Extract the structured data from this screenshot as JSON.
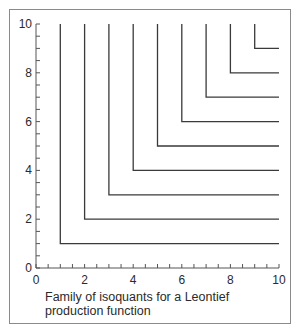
{
  "chart_data": {
    "type": "line",
    "title": "",
    "caption": "Family of isoquants for a Leontief production function",
    "xlabel": "",
    "ylabel": "",
    "xlim": [
      0,
      10
    ],
    "ylim": [
      0,
      10
    ],
    "xticks_labeled": [
      0,
      2,
      4,
      6,
      8,
      10
    ],
    "yticks_labeled": [
      0,
      2,
      4,
      6,
      8,
      10
    ],
    "minor_tick_step": 0.5,
    "grid": false,
    "legend": null,
    "series": [
      {
        "name": "isoquant q=1",
        "corner": [
          1,
          1
        ],
        "points": [
          [
            1,
            10
          ],
          [
            1,
            1
          ],
          [
            10,
            1
          ]
        ]
      },
      {
        "name": "isoquant q=2",
        "corner": [
          2,
          2
        ],
        "points": [
          [
            2,
            10
          ],
          [
            2,
            2
          ],
          [
            10,
            2
          ]
        ]
      },
      {
        "name": "isoquant q=3",
        "corner": [
          3,
          3
        ],
        "points": [
          [
            3,
            10
          ],
          [
            3,
            3
          ],
          [
            10,
            3
          ]
        ]
      },
      {
        "name": "isoquant q=4",
        "corner": [
          4,
          4
        ],
        "points": [
          [
            4,
            10
          ],
          [
            4,
            4
          ],
          [
            10,
            4
          ]
        ]
      },
      {
        "name": "isoquant q=5",
        "corner": [
          5,
          5
        ],
        "points": [
          [
            5,
            10
          ],
          [
            5,
            5
          ],
          [
            10,
            5
          ]
        ]
      },
      {
        "name": "isoquant q=6",
        "corner": [
          6,
          6
        ],
        "points": [
          [
            6,
            10
          ],
          [
            6,
            6
          ],
          [
            10,
            6
          ]
        ]
      },
      {
        "name": "isoquant q=7",
        "corner": [
          7,
          7
        ],
        "points": [
          [
            7,
            10
          ],
          [
            7,
            7
          ],
          [
            10,
            7
          ]
        ]
      },
      {
        "name": "isoquant q=8",
        "corner": [
          8,
          8
        ],
        "points": [
          [
            8,
            10
          ],
          [
            8,
            8
          ],
          [
            10,
            8
          ]
        ]
      },
      {
        "name": "isoquant q=9",
        "corner": [
          9,
          9
        ],
        "points": [
          [
            9,
            10
          ],
          [
            9,
            9
          ],
          [
            10,
            9
          ]
        ]
      }
    ]
  },
  "figure": {
    "caption": "Family of isoquants for a Leontief production function",
    "line_color": "#3a3a3a",
    "axis_color": "#555555",
    "frame_color": "#8a8a8a"
  }
}
